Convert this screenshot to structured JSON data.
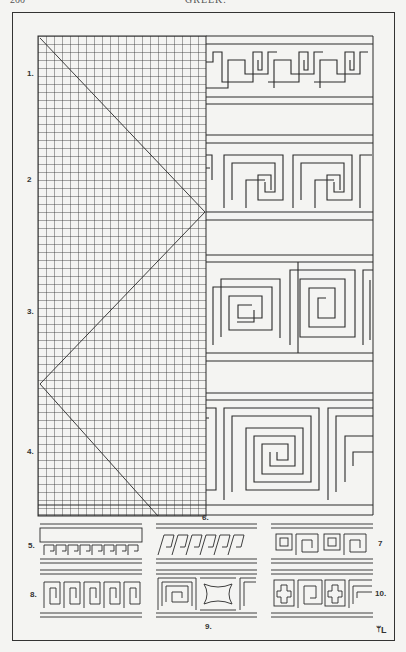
{
  "header": {
    "page_number": "200",
    "running_title": "GREEK."
  },
  "plate": {
    "description": "Greek fret / meander border construction on squared grid",
    "labels": {
      "fig1": "1.",
      "fig2": "2",
      "fig3": "3.",
      "fig4": "4.",
      "fig5": "5.",
      "fig6": "6.",
      "fig7": "7",
      "fig8": "8.",
      "fig9": "9.",
      "fig10": "10."
    },
    "monogram": "ᛘL"
  },
  "colors": {
    "paper": "#f4f4f2",
    "ink": "#2a2a2a"
  }
}
